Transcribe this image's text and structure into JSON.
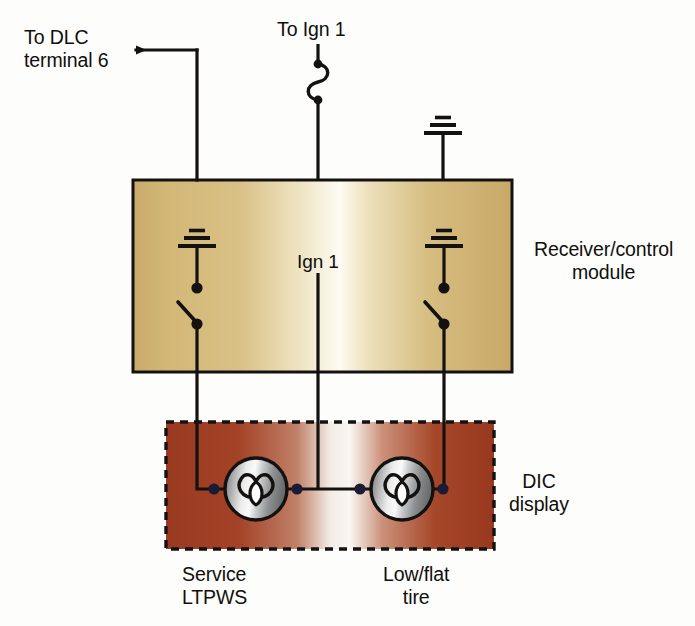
{
  "diagram": {
    "labels": {
      "dlc": "To DLC\nterminal 6",
      "ign_top": "To Ign 1",
      "receiver_module": "Receiver/control\nmodule",
      "ign_inner": "Ign 1",
      "dic_display": "DIC\ndisplay",
      "service_ltpws": "Service\nLTPWS",
      "low_flat_tire": "Low/flat\ntire"
    },
    "blocks": [
      {
        "name": "receiver-control-module",
        "label": "Receiver/control module",
        "x": 133,
        "y": 180,
        "width": 379,
        "height": 192,
        "border": "solid",
        "fill_edge": "#cdb176",
        "fill_center": "#fcfaf0"
      },
      {
        "name": "dic-display",
        "label": "DIC display",
        "x": 166,
        "y": 422,
        "width": 328,
        "height": 127,
        "border": "dashed",
        "fill_edge": "#9d3b22",
        "fill_center": "#f7f2ec"
      }
    ],
    "components": [
      {
        "name": "fuse-ign1",
        "type": "fuse",
        "x": 318,
        "y": 60
      },
      {
        "name": "ground-external-top",
        "type": "ground",
        "x": 443,
        "y": 120
      },
      {
        "name": "ground-module-left",
        "type": "ground",
        "x": 197,
        "y": 233
      },
      {
        "name": "ground-module-right",
        "type": "ground",
        "x": 444,
        "y": 233
      },
      {
        "name": "switch-module-left",
        "type": "switch",
        "x": 197,
        "y": 290
      },
      {
        "name": "switch-module-right",
        "type": "switch",
        "x": 444,
        "y": 290
      },
      {
        "name": "lamp-service-ltpws",
        "type": "indicator-lamp",
        "x": 256,
        "y": 489
      },
      {
        "name": "lamp-low-flat-tire",
        "type": "indicator-lamp",
        "x": 402,
        "y": 489
      }
    ],
    "junctions": [
      {
        "name": "junction-lamp-left-in",
        "x": 214,
        "y": 489
      },
      {
        "name": "junction-lamp-left-out",
        "x": 297,
        "y": 489
      },
      {
        "name": "junction-lamp-right-in",
        "x": 360,
        "y": 489
      },
      {
        "name": "junction-lamp-right-out",
        "x": 443,
        "y": 489
      }
    ],
    "colors": {
      "wire": "#141210",
      "text": "#100f0d",
      "module_fill_edge": "#cdb176",
      "module_fill_center": "#fcfaf0",
      "dic_fill_edge": "#9d3b22",
      "dic_fill_center": "#f7f2ec",
      "lamp_metal_light": "#f2f2f2",
      "lamp_metal_dark": "#848688",
      "junction_dot": "#1b1b33",
      "background": "#fdfdfb"
    }
  }
}
